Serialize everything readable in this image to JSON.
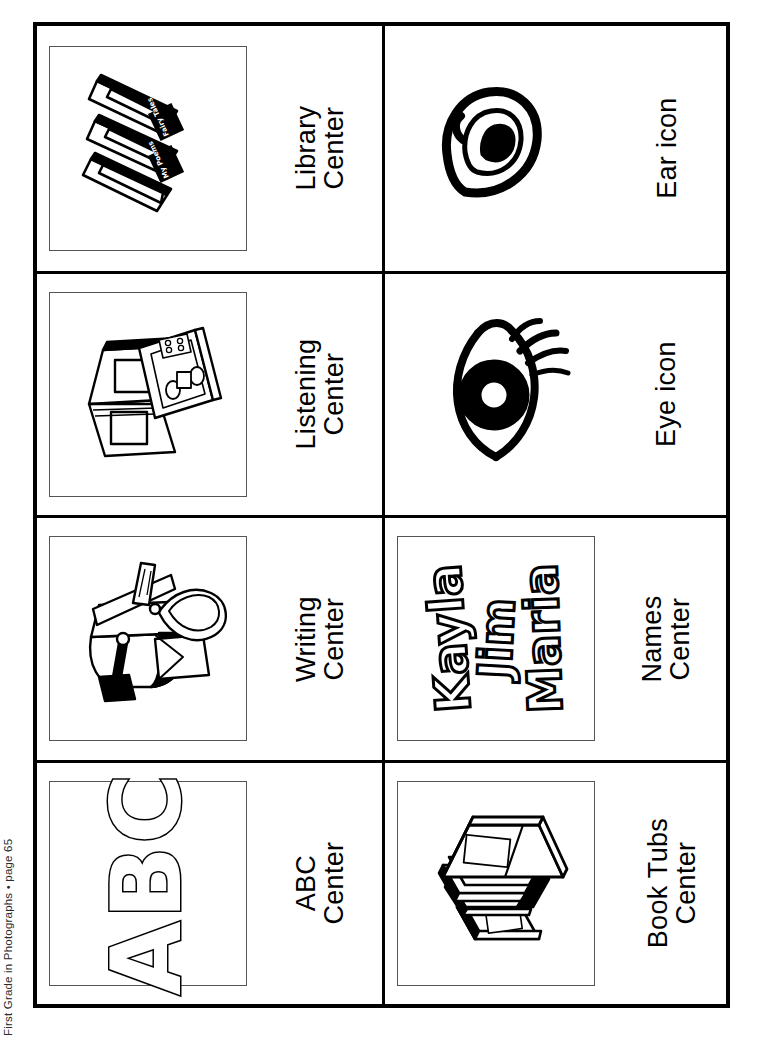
{
  "page": {
    "footer": "First Grade in Photographs  •  page 65"
  },
  "cards": [
    {
      "id": "library-center",
      "icon": "stacked-books-icon",
      "framed": true,
      "label_line1": "Library",
      "label_line2": "Center",
      "book_spines": [
        "My Poems",
        "Fairy Tales"
      ]
    },
    {
      "id": "ear-icon",
      "icon": "ear-icon",
      "framed": false,
      "label_line1": "Ear icon",
      "label_line2": ""
    },
    {
      "id": "listening-center",
      "icon": "book-and-cassette-player-icon",
      "framed": true,
      "label_line1": "Listening",
      "label_line2": "Center"
    },
    {
      "id": "eye-icon",
      "icon": "eye-icon",
      "framed": false,
      "label_line1": "Eye icon",
      "label_line2": ""
    },
    {
      "id": "writing-center",
      "icon": "mailbox-envelope-scissors-icon",
      "framed": true,
      "label_line1": "Writing",
      "label_line2": "Center"
    },
    {
      "id": "names-center",
      "icon": "student-names-icon",
      "framed": true,
      "label_line1": "Names",
      "label_line2": "Center",
      "names": [
        "Kayla",
        "Jim",
        "Maria"
      ]
    },
    {
      "id": "abc-center",
      "icon": "abc-letters-icon",
      "framed": true,
      "label_line1": "ABC",
      "label_line2": "Center",
      "letters": "ABC"
    },
    {
      "id": "book-tubs-center",
      "icon": "book-tub-icon",
      "framed": true,
      "label_line1": "Book Tubs",
      "label_line2": "Center"
    }
  ],
  "colors": {
    "ink": "#000000",
    "paper": "#ffffff",
    "frame_rule": "#555555",
    "footer_text": "#2b2b2b"
  }
}
